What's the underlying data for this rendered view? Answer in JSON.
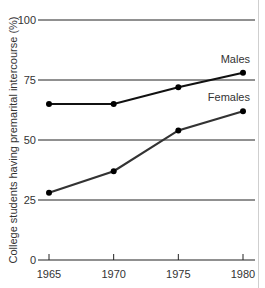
{
  "chart_data": {
    "type": "line",
    "title": "",
    "xlabel": "",
    "ylabel": "College students having premarital intercourse (%)",
    "x": [
      1965,
      1970,
      1975,
      1980
    ],
    "x_tick_labels": [
      "1965",
      "1970",
      "1975",
      "1980"
    ],
    "y_ticks": [
      0,
      25,
      50,
      75,
      100
    ],
    "y_tick_labels": [
      "0",
      "25",
      "50",
      "75",
      "100"
    ],
    "ylim": [
      0,
      100
    ],
    "grid": true,
    "legend": "inline labels near line ends",
    "series": [
      {
        "name": "Males",
        "values": [
          65,
          65,
          72,
          78
        ],
        "color": "#111111"
      },
      {
        "name": "Females",
        "values": [
          28,
          37,
          54,
          62
        ],
        "color": "#333333"
      }
    ]
  }
}
